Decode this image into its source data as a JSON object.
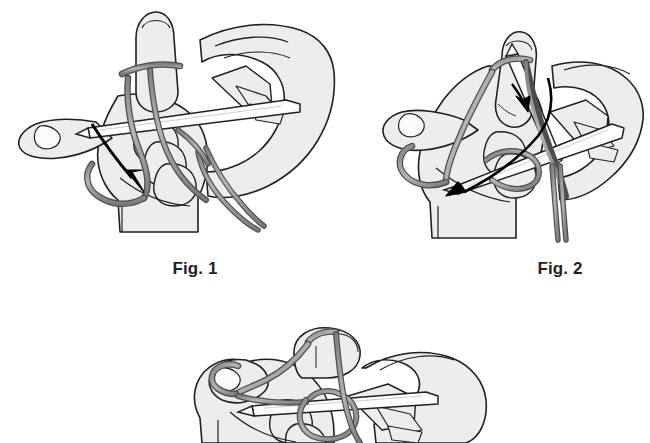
{
  "page": {
    "background_color": "#ffffff",
    "illustration_style": "black-and-white line art with light gray halftone shading"
  },
  "palette": {
    "outline": "#231f20",
    "skin_fill": "#ededed",
    "skin_shade": "#e3e3e3",
    "yarn_fill": "#9a9a9a",
    "yarn_outline": "#4d4d4d",
    "needle_fill": "#fdfdfd",
    "arrow": "#000000",
    "caption_text": "#231f20"
  },
  "figures": [
    {
      "id": "fig1",
      "caption": "Fig. 1",
      "alt": "Left hand with yarn looped over thumb and index finger, knitting needle held across the palm, a black arrow pointing down-left along the yarn strand",
      "has_arrow": true,
      "arrow_direction": "down-left",
      "has_caption": true
    },
    {
      "id": "fig2",
      "caption": "Fig. 2",
      "alt": "Hands tipping the needle up through the thumb loop, a long black arrow curving down-left and a small arrowhead pointing down toward the needle tip",
      "has_arrow": true,
      "arrow_direction": "down-left",
      "has_caption": true
    },
    {
      "id": "fig3",
      "caption": "",
      "alt": "Close-up of the completed loop drawn onto the needle, cropped at the bottom edge of the page",
      "has_arrow": false,
      "arrow_direction": "",
      "has_caption": false
    }
  ]
}
